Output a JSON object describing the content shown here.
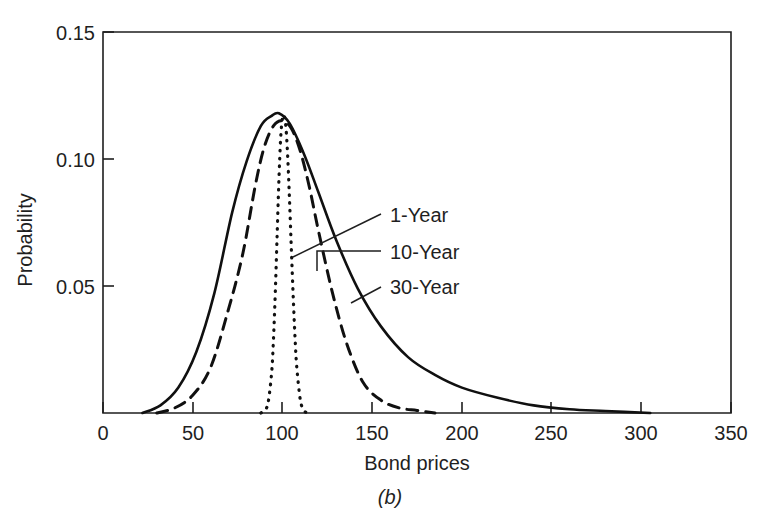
{
  "figure": {
    "caption": "(b)",
    "background_color": "#ffffff",
    "ink_color": "#1f1f1f"
  },
  "chart_data": {
    "type": "line",
    "title": "",
    "xlabel": "Bond prices",
    "ylabel": "Probability",
    "xlim": [
      0,
      350
    ],
    "ylim": [
      0,
      0.15
    ],
    "xticks": [
      0,
      50,
      100,
      150,
      200,
      250,
      300,
      350
    ],
    "xtick_labels": [
      "0",
      "50",
      "100",
      "150",
      "200",
      "250",
      "300",
      "350"
    ],
    "yticks": [
      0.05,
      0.1,
      0.15
    ],
    "ytick_labels": [
      "0.05",
      "0.10",
      "0.15"
    ],
    "grid": false,
    "legend_position": "inside-right-annotations",
    "series": [
      {
        "name": "1-Year",
        "style": "dotted",
        "peak_x": 101,
        "peak_y": 0.117,
        "spread": 4.2,
        "x": [
          88,
          90,
          92,
          94,
          95,
          96,
          97,
          98,
          99,
          100,
          101,
          102,
          103,
          104,
          105,
          106,
          107,
          108,
          110,
          112,
          114
        ],
        "y": [
          0.0,
          0.001,
          0.004,
          0.016,
          0.029,
          0.047,
          0.069,
          0.091,
          0.108,
          0.116,
          0.117,
          0.112,
          0.1,
          0.083,
          0.064,
          0.046,
          0.03,
          0.018,
          0.005,
          0.001,
          0.0
        ]
      },
      {
        "name": "10-Year",
        "style": "dashed",
        "peak_x": 100,
        "peak_y": 0.115,
        "spread": 19,
        "x": [
          30,
          40,
          50,
          60,
          70,
          78,
          85,
          90,
          95,
          100,
          105,
          110,
          115,
          120,
          128,
          136,
          145,
          155,
          165,
          175,
          185
        ],
        "y": [
          0.0,
          0.002,
          0.007,
          0.018,
          0.041,
          0.063,
          0.09,
          0.105,
          0.113,
          0.115,
          0.112,
          0.103,
          0.089,
          0.072,
          0.047,
          0.027,
          0.012,
          0.005,
          0.002,
          0.001,
          0.0
        ]
      },
      {
        "name": "30-Year",
        "style": "solid",
        "peak_x": 98,
        "peak_y": 0.118,
        "spread": 26,
        "x": [
          22,
          32,
          42,
          52,
          62,
          72,
          80,
          88,
          94,
          98,
          104,
          112,
          120,
          130,
          142,
          155,
          170,
          185,
          200,
          220,
          240,
          260,
          280,
          305
        ],
        "y": [
          0.0,
          0.003,
          0.01,
          0.024,
          0.047,
          0.079,
          0.099,
          0.113,
          0.117,
          0.118,
          0.114,
          0.102,
          0.087,
          0.068,
          0.049,
          0.034,
          0.022,
          0.015,
          0.01,
          0.006,
          0.003,
          0.0015,
          0.0008,
          0.0
        ]
      }
    ],
    "annotations": [
      {
        "text": "1-Year",
        "label_x": 390,
        "label_y": 222
      },
      {
        "text": "10-Year",
        "label_x": 390,
        "label_y": 259
      },
      {
        "text": "30-Year",
        "label_x": 390,
        "label_y": 294
      }
    ]
  }
}
